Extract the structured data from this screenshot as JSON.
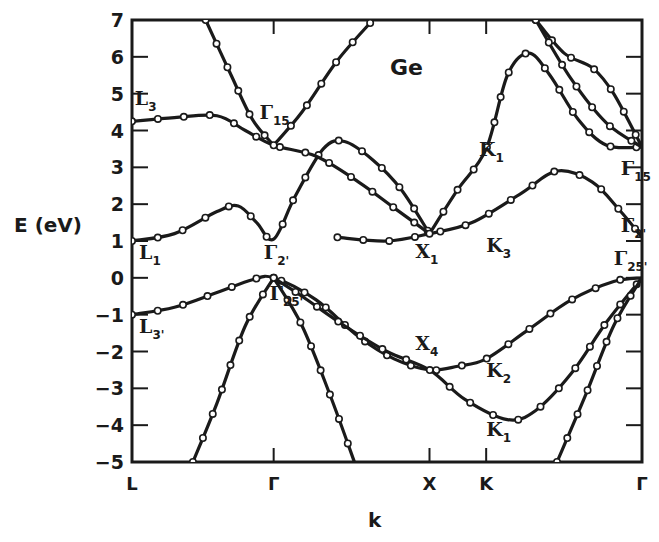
{
  "chart_data": {
    "type": "line",
    "title": "Ge",
    "xlabel": "k",
    "ylabel": "E (eV)",
    "ylim": [
      -5,
      7
    ],
    "yticks": [
      7,
      6,
      5,
      4,
      3,
      2,
      1,
      0,
      -1,
      -2,
      -3,
      -4,
      -5
    ],
    "ytick_labels": [
      "7",
      "6",
      "5",
      "4",
      "3",
      "2",
      "1",
      "0",
      "−1",
      "−2",
      "−3",
      "−4",
      "−5"
    ],
    "x_points": [
      {
        "label": "L",
        "pos": 0.0
      },
      {
        "label": "Γ",
        "pos": 1.0
      },
      {
        "label": "X",
        "pos": 2.1
      },
      {
        "label": "K",
        "pos": 2.5
      },
      {
        "label": "Γ",
        "pos": 3.6
      }
    ],
    "grid": false,
    "legend": null,
    "series": [
      {
        "name": "valence band 1 (L3'→Γ25'→X4→K2→Γ25')",
        "points": [
          [
            0,
            -1.0
          ],
          [
            0.3,
            -0.8
          ],
          [
            0.6,
            -0.4
          ],
          [
            0.85,
            -0.05
          ],
          [
            1.0,
            0.0
          ],
          [
            1.3,
            -0.6
          ],
          [
            1.6,
            -1.6
          ],
          [
            1.85,
            -2.2
          ],
          [
            2.1,
            -2.5
          ],
          [
            2.3,
            -2.4
          ],
          [
            2.5,
            -2.2
          ],
          [
            2.8,
            -1.4
          ],
          [
            3.1,
            -0.6
          ],
          [
            3.4,
            -0.1
          ],
          [
            3.6,
            0.0
          ]
        ]
      },
      {
        "name": "valence band 2 (Γ25'→X4→K1→Γ25')",
        "points": [
          [
            1.0,
            0.0
          ],
          [
            1.2,
            -0.5
          ],
          [
            1.5,
            -1.3
          ],
          [
            1.8,
            -2.0
          ],
          [
            2.1,
            -2.5
          ],
          [
            2.35,
            -3.3
          ],
          [
            2.65,
            -3.85
          ],
          [
            2.85,
            -3.6
          ],
          [
            3.1,
            -2.6
          ],
          [
            3.35,
            -1.2
          ],
          [
            3.6,
            0.0
          ]
        ]
      },
      {
        "name": "valence band 3 (Γ25'→ down, L side)",
        "points": [
          [
            0.43,
            -5.0
          ],
          [
            0.6,
            -3.4
          ],
          [
            0.8,
            -1.3
          ],
          [
            1.0,
            0.0
          ]
        ]
      },
      {
        "name": "valence band 4 (Γ25'→ down, X side)",
        "points": [
          [
            1.0,
            0.0
          ],
          [
            1.2,
            -1.3
          ],
          [
            1.4,
            -3.2
          ],
          [
            1.57,
            -5.0
          ]
        ]
      },
      {
        "name": "valence band 5 (K side → Γ25')",
        "points": [
          [
            3.0,
            -5.0
          ],
          [
            3.2,
            -3.2
          ],
          [
            3.4,
            -1.3
          ],
          [
            3.6,
            0.0
          ]
        ]
      },
      {
        "name": "conduction band L1→Γ2'→Γ15",
        "points": [
          [
            0,
            1.0
          ],
          [
            0.3,
            1.2
          ],
          [
            0.6,
            1.8
          ],
          [
            0.75,
            1.95
          ],
          [
            0.88,
            1.5
          ],
          [
            1.0,
            1.05
          ],
          [
            1.15,
            2.2
          ],
          [
            1.35,
            3.5
          ],
          [
            1.5,
            3.7
          ],
          [
            1.7,
            3.2
          ],
          [
            1.9,
            2.4
          ],
          [
            2.1,
            1.2
          ]
        ]
      },
      {
        "name": "conduction band L1→X1→K3→Γ2'",
        "points": [
          [
            1.45,
            1.1
          ],
          [
            1.8,
            1.0
          ],
          [
            2.1,
            1.2
          ],
          [
            2.4,
            1.5
          ],
          [
            2.75,
            2.3
          ],
          [
            3.0,
            2.9
          ],
          [
            3.25,
            2.6
          ],
          [
            3.45,
            1.8
          ],
          [
            3.6,
            1.1
          ]
        ]
      },
      {
        "name": "conduction band L3→Γ15→X1",
        "points": [
          [
            0,
            4.25
          ],
          [
            0.3,
            4.35
          ],
          [
            0.6,
            4.4
          ],
          [
            0.8,
            4.0
          ],
          [
            1.0,
            3.6
          ],
          [
            1.3,
            3.3
          ],
          [
            1.6,
            2.6
          ],
          [
            1.85,
            1.9
          ],
          [
            2.1,
            1.2
          ]
        ]
      },
      {
        "name": "conduction band X1→K1→Γ15",
        "points": [
          [
            2.1,
            1.2
          ],
          [
            2.3,
            2.4
          ],
          [
            2.5,
            3.5
          ],
          [
            2.65,
            5.5
          ],
          [
            2.8,
            6.1
          ],
          [
            2.95,
            5.5
          ],
          [
            3.15,
            4.3
          ],
          [
            3.35,
            3.6
          ],
          [
            3.6,
            3.55
          ]
        ]
      },
      {
        "name": "conduction band Γ15 left-high",
        "points": [
          [
            0.52,
            7.0
          ],
          [
            0.7,
            5.5
          ],
          [
            0.85,
            4.3
          ],
          [
            1.0,
            3.6
          ]
        ]
      },
      {
        "name": "conduction band Γ15 right-high",
        "points": [
          [
            1.0,
            3.6
          ],
          [
            1.2,
            4.5
          ],
          [
            1.45,
            5.9
          ],
          [
            1.7,
            7.0
          ]
        ]
      },
      {
        "name": "upper band A → Γ15",
        "points": [
          [
            2.85,
            7.0
          ],
          [
            3.05,
            6.1
          ],
          [
            3.25,
            5.7
          ],
          [
            3.4,
            5.0
          ],
          [
            3.6,
            3.55
          ]
        ]
      },
      {
        "name": "upper band B → Γ15",
        "points": [
          [
            2.85,
            7.0
          ],
          [
            3.1,
            5.4
          ],
          [
            3.35,
            4.2
          ],
          [
            3.6,
            3.55
          ]
        ]
      }
    ],
    "annotations": [
      {
        "text": "L",
        "sub": "3",
        "x": 0.02,
        "y": 4.7
      },
      {
        "text": "Γ",
        "sub": "15",
        "x": 0.9,
        "y": 4.3
      },
      {
        "text": "L",
        "sub": "1",
        "x": 0.05,
        "y": 0.5
      },
      {
        "text": "Γ",
        "sub": "2'",
        "x": 0.93,
        "y": 0.5
      },
      {
        "text": "X",
        "sub": "1",
        "x": 2.0,
        "y": 0.55
      },
      {
        "text": "K",
        "sub": "3",
        "x": 2.5,
        "y": 0.7
      },
      {
        "text": "K",
        "sub": "1",
        "x": 2.45,
        "y": 3.3
      },
      {
        "text": "Γ",
        "sub": "15",
        "x": 3.45,
        "y": 2.8
      },
      {
        "text": "Γ",
        "sub": "2'",
        "x": 3.45,
        "y": 1.25
      },
      {
        "text": "Γ",
        "sub": "25'",
        "x": 3.4,
        "y": 0.35
      },
      {
        "text": "L",
        "sub": "3'",
        "x": 0.05,
        "y": -1.5
      },
      {
        "text": "Γ",
        "sub": "25'",
        "x": 0.97,
        "y": -0.6
      },
      {
        "text": "X",
        "sub": "4",
        "x": 2.0,
        "y": -1.95
      },
      {
        "text": "K",
        "sub": "2",
        "x": 2.5,
        "y": -2.7
      },
      {
        "text": "K",
        "sub": "1",
        "x": 2.5,
        "y": -4.3
      }
    ]
  },
  "labels": {
    "title": "Ge",
    "xlabel": "k",
    "ylabel": "E (eV)"
  }
}
